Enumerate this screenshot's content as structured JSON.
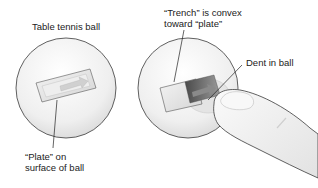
{
  "figure": {
    "left_panel": {
      "title": "Table tennis ball",
      "plate_label_line1": "“Plate” on",
      "plate_label_line2": "surface of ball"
    },
    "right_panel": {
      "trench_label_line1": "“Trench” is convex",
      "trench_label_line2": "toward “plate”",
      "dent_label": "Dent in ball"
    },
    "colors": {
      "ball_fill": "#f2f2f2",
      "ball_outline": "#3a3a3a",
      "plate_fill": "#e6e6e6",
      "trench_dark": "#6a6a6a",
      "finger_fill": "#f4f4f4"
    }
  }
}
